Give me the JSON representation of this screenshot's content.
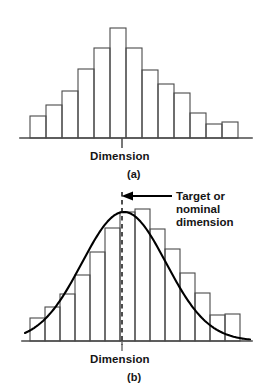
{
  "figure": {
    "title_implicit": "",
    "panels": [
      {
        "key": "a",
        "caption": "(a)",
        "axis_label": "Dimension"
      },
      {
        "key": "b",
        "caption": "(b)",
        "axis_label": "Dimension"
      }
    ],
    "annotation": {
      "line1": "Target or",
      "line2": "nominal",
      "line3": "dimension"
    },
    "colors": {
      "stroke": "#4a4a4a",
      "curve": "#000000",
      "axis": "#4a4a4a",
      "text": "#151515",
      "background": "#ffffff"
    }
  },
  "chart_data": [
    {
      "type": "bar",
      "id": "panel-a-histogram",
      "title": "(a)",
      "xlabel": "Dimension",
      "ylabel": "",
      "grid": false,
      "legend": false,
      "axis": {
        "baseline_y": 138,
        "x_start": 20,
        "x_end": 252
      },
      "bar_width": 16,
      "bar_origin_x": 30,
      "categories": [
        "1",
        "2",
        "3",
        "4",
        "5",
        "6",
        "7",
        "8",
        "9",
        "10",
        "11",
        "12",
        "13"
      ],
      "values": [
        4,
        8,
        12,
        18,
        22,
        25,
        22,
        18,
        15,
        12,
        7,
        4,
        4
      ],
      "pixel_tops": [
        116,
        105,
        91,
        69,
        48,
        28,
        48,
        70,
        84,
        93,
        113,
        124,
        122
      ],
      "peak_index": 5,
      "ylim": [
        0,
        26
      ]
    },
    {
      "type": "bar",
      "id": "panel-b-histogram-with-normal-curve",
      "title": "(b)",
      "xlabel": "Dimension",
      "ylabel": "",
      "grid": false,
      "legend": false,
      "axis": {
        "baseline_y": 341,
        "x_start": 22,
        "x_end": 252
      },
      "bar_width": 15,
      "bar_origin_x": 30,
      "categories": [
        "1",
        "2",
        "3",
        "4",
        "5",
        "6",
        "7",
        "8",
        "9",
        "10",
        "11",
        "12",
        "13",
        "14"
      ],
      "values": [
        3,
        6,
        10,
        15,
        21,
        26,
        30,
        30,
        26,
        21,
        15,
        9,
        5,
        5
      ],
      "pixel_tops": [
        318,
        307,
        294,
        275,
        252,
        228,
        212,
        209,
        229,
        249,
        273,
        293,
        315,
        314
      ],
      "overlay": {
        "type": "line",
        "name": "Normal distribution curve",
        "mean_x": 124,
        "peak_y": 212,
        "baseline_y": 341,
        "sigma_px": 42
      },
      "marker": {
        "type": "vertical-dashed-line",
        "name": "Target or nominal dimension",
        "x": 122,
        "y_top": 192,
        "y_bottom": 345
      },
      "ylim": [
        0,
        32
      ]
    }
  ]
}
